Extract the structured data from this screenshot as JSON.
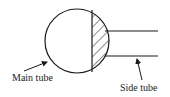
{
  "diagram": {
    "title": "",
    "labels": {
      "main_tube": "Main tube",
      "side_tube": "Side tube"
    },
    "colors": {
      "stroke": "#1a1a1a",
      "background": "#ffffff"
    },
    "shapes": {
      "main_tube_circle": {
        "cx": 77,
        "cy": 41,
        "r": 32
      },
      "divider_x": 92,
      "side_tube_lines": {
        "x_start": 104,
        "x_end": 158,
        "y_top": 31,
        "y_bottom": 56
      }
    }
  }
}
